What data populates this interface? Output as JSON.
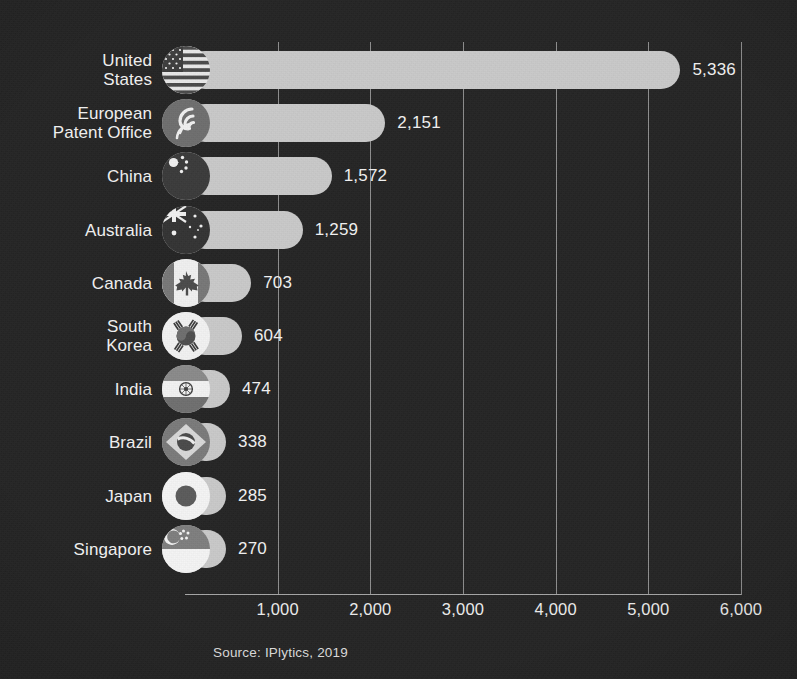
{
  "chart_data": {
    "type": "bar",
    "orientation": "horizontal",
    "title": "",
    "subtitle": "",
    "xlabel": "",
    "ylabel": "",
    "xlim": [
      0,
      6000
    ],
    "grid": true,
    "legend": null,
    "source": "Source: IPlytics, 2019",
    "tick_labels": [
      "1,000",
      "2,000",
      "3,000",
      "4,000",
      "5,000",
      "6,000"
    ],
    "ticks": [
      1000,
      2000,
      3000,
      4000,
      5000,
      6000
    ],
    "categories": [
      "United\nStates",
      "European\nPatent Office",
      "China",
      "Australia",
      "Canada",
      "South\nKorea",
      "India",
      "Brazil",
      "Japan",
      "Singapore"
    ],
    "values": [
      5336,
      2151,
      1572,
      1259,
      703,
      604,
      474,
      338,
      285,
      270
    ],
    "value_labels": [
      "5,336",
      "2,151",
      "1,572",
      "1,259",
      "703",
      "604",
      "474",
      "338",
      "285",
      "270"
    ],
    "flags": [
      "flag-united-states-icon",
      "flag-european-patent-office-icon",
      "flag-china-icon",
      "flag-australia-icon",
      "flag-canada-icon",
      "flag-south-korea-icon",
      "flag-india-icon",
      "flag-brazil-icon",
      "flag-japan-icon",
      "flag-singapore-icon"
    ]
  },
  "colors": {
    "background": "#242424",
    "bar": "#c9c9c9",
    "gridline": "#8d8d8d",
    "axis": "#a5a5a5",
    "text": "#f2f2f2"
  },
  "footer": {
    "source": "Source: IPlytics, 2019"
  }
}
